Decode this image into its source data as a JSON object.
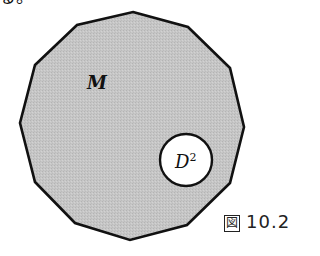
{
  "page": {
    "fragment_text": "る。"
  },
  "figure": {
    "region_label": "M",
    "disk_label_base": "D",
    "disk_label_superscript": "2",
    "caption_prefix": "図",
    "caption_number": "10.2",
    "polygon_points": [
      [
        133,
        12
      ],
      [
        188,
        27
      ],
      [
        230,
        68
      ],
      [
        244,
        127
      ],
      [
        230,
        183
      ],
      [
        187,
        225
      ],
      [
        130,
        240
      ],
      [
        75,
        223
      ],
      [
        35,
        182
      ],
      [
        20,
        123
      ],
      [
        35,
        65
      ],
      [
        77,
        25
      ]
    ],
    "disk": {
      "cx": 186,
      "cy": 160,
      "r": 26
    },
    "colors": {
      "region_fill": "#c4c4c4",
      "outline": "#111111",
      "disk_fill": "#ffffff"
    }
  }
}
